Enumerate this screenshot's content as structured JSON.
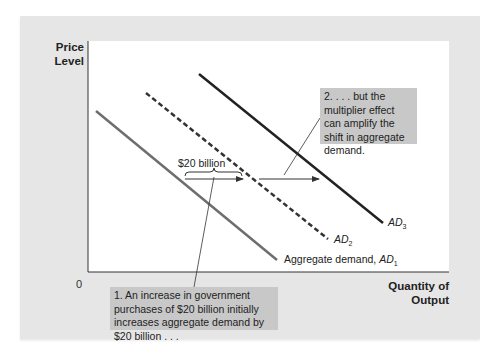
{
  "axes": {
    "y_label_line1": "Price",
    "y_label_line2": "Level",
    "x_label_line1": "Quantity of",
    "x_label_line2": "Output",
    "origin": "0"
  },
  "curves": {
    "ad1": {
      "prefix": "Aggregate demand, ",
      "name": "AD",
      "sub": "1",
      "style": "solid",
      "color": "#6e6e6e"
    },
    "ad2": {
      "name": "AD",
      "sub": "2",
      "style": "dashed",
      "color": "#333333"
    },
    "ad3": {
      "name": "AD",
      "sub": "3",
      "style": "solid",
      "color": "#222222"
    }
  },
  "shift": {
    "brace_label": "$20 billion"
  },
  "annotations": {
    "note1": "1. An increase in government purchases of $20 billion initially increases aggregate demand by $20 billion . . .",
    "note2": "2. . . . but the multiplier effect can amplify the shift in aggregate demand."
  },
  "colors": {
    "panel": "#e6e6e6",
    "plot": "#ffffff",
    "note_bg": "#c8c8c8"
  }
}
